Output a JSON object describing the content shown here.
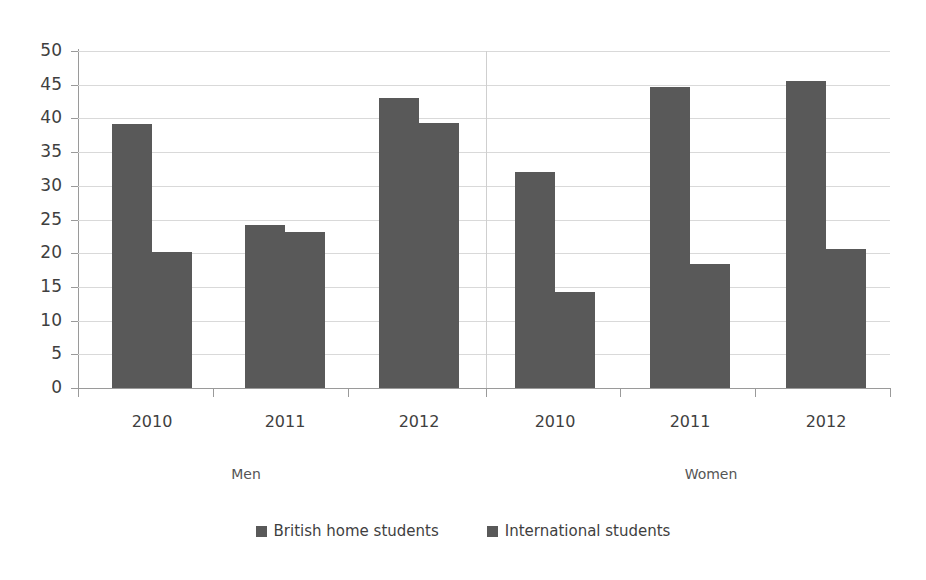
{
  "chart_data": {
    "type": "bar",
    "title": "",
    "xlabel": "",
    "ylabel": "",
    "ylim": [
      0,
      50
    ],
    "ytick_step": 5,
    "yticks": [
      "50",
      "45",
      "40",
      "35",
      "30",
      "25",
      "20",
      "15",
      "10",
      "5",
      "0"
    ],
    "grid": true,
    "legend_position": "bottom",
    "categories": [
      "2010",
      "2011",
      "2012",
      "2010",
      "2011",
      "2012"
    ],
    "groups": [
      {
        "name": "Men",
        "categories": [
          "2010",
          "2011",
          "2012"
        ]
      },
      {
        "name": "Women",
        "categories": [
          "2010",
          "2011",
          "2012"
        ]
      }
    ],
    "series": [
      {
        "name": "British home students",
        "color": "#595959",
        "values": [
          39.1,
          24.2,
          43.1,
          32.1,
          44.6,
          45.5
        ]
      },
      {
        "name": "International students",
        "color": "#595959",
        "values": [
          20.2,
          23.2,
          39.3,
          14.2,
          18.4,
          20.6
        ]
      }
    ]
  },
  "axis": {
    "y_tick_labels": [
      "50",
      "45",
      "40",
      "35",
      "30",
      "25",
      "20",
      "15",
      "10",
      "5",
      "0"
    ],
    "x_tick_labels": [
      "2010",
      "2011",
      "2012",
      "2010",
      "2011",
      "2012"
    ]
  },
  "group_labels": [
    "Men",
    "Women"
  ],
  "legend": {
    "items": [
      {
        "label": "British home students",
        "color": "#595959"
      },
      {
        "label": "International students",
        "color": "#595959"
      }
    ]
  },
  "colors": {
    "bar": "#595959",
    "grid": "#d9d9d9",
    "axis": "#9a9a9a",
    "text": "#3f3f3f",
    "background": "#ffffff"
  }
}
